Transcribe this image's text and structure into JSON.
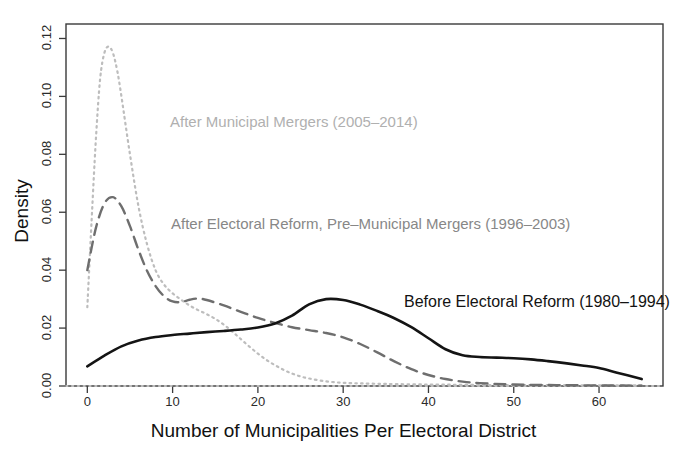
{
  "chart_data": {
    "type": "line",
    "title": "",
    "subtitle": "",
    "xlabel": "Number of Municipalities Per Electoral District",
    "ylabel": "Density",
    "xlim": [
      -2.5,
      67.5
    ],
    "ylim": [
      0.0,
      0.125
    ],
    "xticks": [
      0,
      10,
      20,
      30,
      40,
      50,
      60
    ],
    "xticklabels": [
      "0",
      "10",
      "20",
      "30",
      "40",
      "50",
      "60"
    ],
    "yticks": [
      0.0,
      0.02,
      0.04,
      0.06,
      0.08,
      0.1,
      0.12
    ],
    "yticklabels": [
      "0.00",
      "0.02",
      "0.04",
      "0.06",
      "0.08",
      "0.10",
      "0.12"
    ],
    "grid": false,
    "legend_position": "inline-annotations",
    "series": [
      {
        "name": "Before Electoral Reform (1980-1994)",
        "label": "Before Electoral Reform (1980–1994)",
        "style": "solid",
        "color": "#141414",
        "linewidth": 2.6,
        "x": [
          0,
          2,
          4,
          6,
          8,
          10,
          12,
          14,
          16,
          18,
          20,
          22,
          24,
          26,
          28,
          30,
          32,
          34,
          36,
          38,
          40,
          42,
          44,
          46,
          48,
          50,
          52,
          54,
          56,
          58,
          60,
          62,
          65
        ],
        "y": [
          0.0068,
          0.0105,
          0.0137,
          0.0157,
          0.0169,
          0.0176,
          0.0181,
          0.0186,
          0.019,
          0.0195,
          0.0202,
          0.0216,
          0.0243,
          0.0282,
          0.03,
          0.0297,
          0.0281,
          0.0259,
          0.0234,
          0.0203,
          0.0165,
          0.0127,
          0.0106,
          0.01,
          0.0098,
          0.0096,
          0.0092,
          0.0086,
          0.0079,
          0.0071,
          0.0062,
          0.0047,
          0.0024
        ]
      },
      {
        "name": "After Electoral Reform, Pre-Municipal Mergers (1996-2003)",
        "label": "After Electoral Reform, Pre–Municipal Mergers (1996–2003)",
        "style": "dashed",
        "color": "#6e6e6e",
        "linewidth": 2.4,
        "x": [
          0,
          1,
          2,
          3,
          4,
          5,
          6,
          7,
          8,
          9,
          10,
          11,
          12,
          13,
          14,
          16,
          18,
          20,
          22,
          24,
          26,
          28,
          30,
          32,
          34,
          36,
          38,
          40,
          42,
          44,
          46,
          50,
          55,
          60,
          65
        ],
        "y": [
          0.04,
          0.0545,
          0.063,
          0.0652,
          0.062,
          0.0552,
          0.047,
          0.0398,
          0.0345,
          0.031,
          0.0292,
          0.029,
          0.0298,
          0.0302,
          0.0297,
          0.0278,
          0.0256,
          0.0235,
          0.0218,
          0.0203,
          0.0193,
          0.0183,
          0.0168,
          0.0145,
          0.0116,
          0.0085,
          0.0058,
          0.0038,
          0.0024,
          0.0015,
          0.001,
          0.0005,
          0.0003,
          0.0002,
          0.0001
        ]
      },
      {
        "name": "After Municipal Mergers (2005-2014)",
        "label": "After Municipal Mergers (2005–2014)",
        "style": "dotted",
        "color": "#bdbdbd",
        "linewidth": 2.2,
        "x": [
          0,
          0.5,
          1,
          1.5,
          2,
          2.5,
          3,
          3.5,
          4,
          5,
          6,
          7,
          8,
          9,
          10,
          11,
          12,
          13,
          14,
          15,
          16,
          17,
          18,
          19,
          20,
          21,
          22,
          23,
          24,
          25,
          26,
          28,
          30,
          32,
          35,
          40,
          45,
          50,
          55,
          60,
          65
        ],
        "y": [
          0.0272,
          0.057,
          0.085,
          0.106,
          0.115,
          0.1172,
          0.115,
          0.109,
          0.1,
          0.08,
          0.062,
          0.049,
          0.04,
          0.035,
          0.032,
          0.0298,
          0.0278,
          0.0262,
          0.0248,
          0.0232,
          0.0212,
          0.0188,
          0.0162,
          0.0136,
          0.0112,
          0.009,
          0.0072,
          0.0056,
          0.0043,
          0.0033,
          0.0026,
          0.0016,
          0.0011,
          0.0009,
          0.0007,
          0.0005,
          0.0004,
          0.0003,
          0.0003,
          0.0002,
          0.0002
        ]
      }
    ],
    "annotations": [
      {
        "text": "After Municipal Mergers (2005–2014)",
        "series": "After Municipal Mergers (2005-2014)",
        "x": 10.0,
        "y": 0.094
      },
      {
        "text": "After Electoral Reform, Pre–Municipal Mergers (1996–2003)",
        "series": "After Electoral Reform, Pre-Municipal Mergers (1996-2003)",
        "x": 10.0,
        "y": 0.056
      },
      {
        "text": "Before Electoral Reform (1980–1994)",
        "series": "Before Electoral Reform (1980-1994)",
        "x": 37.0,
        "y": 0.028
      }
    ],
    "colors": {
      "solid": "#141414",
      "dashed": "#6e6e6e",
      "dotted": "#bdbdbd",
      "axis": "#333333",
      "background": "#ffffff"
    }
  }
}
